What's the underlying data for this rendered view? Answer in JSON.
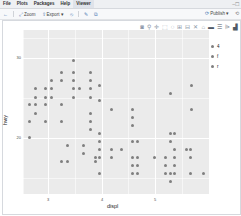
{
  "menubar": {
    "items": [
      "File",
      "Plots",
      "Packages",
      "Help",
      "Viewer"
    ],
    "active_index": 4,
    "window_controls": "–☐"
  },
  "toolbar": {
    "zoom_label": "Zoom",
    "export_label": "Export",
    "export_caret": "▾",
    "publish_label": "Publish",
    "publish_caret": "▾",
    "icons": {
      "back": "←",
      "zoom": "⤢",
      "export": "⇪",
      "clear": "⦸",
      "brush": "✎",
      "copy": "⧉",
      "publish": "⟳",
      "refresh": "⟲"
    }
  },
  "modebar": {
    "icons": [
      {
        "name": "camera-icon",
        "glyph": "◙"
      },
      {
        "name": "zoom-icon",
        "glyph": "⚲"
      },
      {
        "name": "pan-icon",
        "glyph": "✛"
      },
      {
        "name": "box-select-icon",
        "glyph": "⬚"
      },
      {
        "name": "lasso-icon",
        "glyph": "◌"
      },
      {
        "name": "zoom-in-icon",
        "glyph": "⊞"
      },
      {
        "name": "zoom-out-icon",
        "glyph": "⊟"
      },
      {
        "name": "autoscale-icon",
        "glyph": "✕"
      },
      {
        "name": "reset-axes-icon",
        "glyph": "⌂"
      },
      {
        "name": "spike-lines-icon",
        "glyph": "▬"
      },
      {
        "name": "compare-hover-icon",
        "glyph": "☰"
      },
      {
        "name": "closest-hover-icon",
        "glyph": "⩥"
      },
      {
        "name": "plotly-logo-icon",
        "glyph": "▟"
      }
    ]
  },
  "colors": {
    "panel_bg": "#ebebeb",
    "point": "#7f7f7f",
    "grid": "#ffffff"
  },
  "chart_data": {
    "type": "scatter",
    "title": "",
    "xlabel": "displ",
    "ylabel": "hwy",
    "x_ticks": [
      3,
      4,
      5
    ],
    "y_ticks": [
      20,
      30
    ],
    "x_tick_labels": [
      "3",
      "4",
      "5"
    ],
    "y_tick_labels": [
      "20",
      "30"
    ],
    "xlim": [
      2.5,
      6.0
    ],
    "ylim": [
      15.5,
      36
    ],
    "grid": true,
    "legend": {
      "position": "right",
      "title": "",
      "entries": [
        "4",
        "f",
        "r"
      ]
    },
    "points": [
      {
        "x": 3.49,
        "y": 29.6
      },
      {
        "x": 3.28,
        "y": 28.1
      },
      {
        "x": 3.49,
        "y": 28.1
      },
      {
        "x": 3.81,
        "y": 28.1
      },
      {
        "x": 3.09,
        "y": 27.1
      },
      {
        "x": 3.28,
        "y": 27.1
      },
      {
        "x": 3.49,
        "y": 27.1
      },
      {
        "x": 3.81,
        "y": 27.1
      },
      {
        "x": 2.78,
        "y": 26.1
      },
      {
        "x": 2.98,
        "y": 26.1
      },
      {
        "x": 3.09,
        "y": 26.1
      },
      {
        "x": 3.49,
        "y": 26.1
      },
      {
        "x": 3.6,
        "y": 26.1
      },
      {
        "x": 3.81,
        "y": 26.1
      },
      {
        "x": 2.78,
        "y": 25.0
      },
      {
        "x": 2.98,
        "y": 25.0
      },
      {
        "x": 3.09,
        "y": 25.0
      },
      {
        "x": 3.49,
        "y": 25.0
      },
      {
        "x": 3.81,
        "y": 25.0
      },
      {
        "x": 2.68,
        "y": 24.1
      },
      {
        "x": 2.78,
        "y": 24.1
      },
      {
        "x": 2.98,
        "y": 24.1
      },
      {
        "x": 3.28,
        "y": 24.1
      },
      {
        "x": 2.78,
        "y": 23.0
      },
      {
        "x": 3.81,
        "y": 23.0
      },
      {
        "x": 2.68,
        "y": 22.0
      },
      {
        "x": 2.98,
        "y": 22.0
      },
      {
        "x": 3.28,
        "y": 22.0
      },
      {
        "x": 3.81,
        "y": 22.0
      },
      {
        "x": 3.81,
        "y": 21.0
      },
      {
        "x": 2.68,
        "y": 20.0
      },
      {
        "x": 3.39,
        "y": 19.0
      },
      {
        "x": 3.69,
        "y": 19.0
      },
      {
        "x": 3.69,
        "y": 18.0
      },
      {
        "x": 3.28,
        "y": 17.0
      },
      {
        "x": 3.39,
        "y": 17.0
      },
      {
        "x": 3.9,
        "y": 17.0
      },
      {
        "x": 3.99,
        "y": 26.5
      },
      {
        "x": 5.71,
        "y": 26.5
      },
      {
        "x": 5.3,
        "y": 25.5
      },
      {
        "x": 3.99,
        "y": 24.6
      },
      {
        "x": 4.2,
        "y": 23.5
      },
      {
        "x": 4.59,
        "y": 23.5
      },
      {
        "x": 5.71,
        "y": 23.5
      },
      {
        "x": 4.59,
        "y": 22.5
      },
      {
        "x": 4.59,
        "y": 21.5
      },
      {
        "x": 3.99,
        "y": 20.5
      },
      {
        "x": 5.3,
        "y": 20.5
      },
      {
        "x": 5.39,
        "y": 20.5
      },
      {
        "x": 3.99,
        "y": 19.5
      },
      {
        "x": 4.59,
        "y": 19.5
      },
      {
        "x": 4.7,
        "y": 19.5
      },
      {
        "x": 5.3,
        "y": 19.5
      },
      {
        "x": 3.99,
        "y": 18.5
      },
      {
        "x": 4.2,
        "y": 18.5
      },
      {
        "x": 4.4,
        "y": 18.5
      },
      {
        "x": 5.39,
        "y": 18.5
      },
      {
        "x": 5.6,
        "y": 18.5
      },
      {
        "x": 5.69,
        "y": 18.5
      },
      {
        "x": 3.9,
        "y": 17.5
      },
      {
        "x": 3.99,
        "y": 17.5
      },
      {
        "x": 4.2,
        "y": 17.5
      },
      {
        "x": 4.59,
        "y": 17.5
      },
      {
        "x": 4.7,
        "y": 17.5
      },
      {
        "x": 5.0,
        "y": 17.5
      },
      {
        "x": 5.21,
        "y": 17.5
      },
      {
        "x": 5.39,
        "y": 17.5
      },
      {
        "x": 5.69,
        "y": 17.5
      },
      {
        "x": 4.59,
        "y": 16.5
      },
      {
        "x": 4.7,
        "y": 16.5
      },
      {
        "x": 5.21,
        "y": 16.5
      },
      {
        "x": 5.39,
        "y": 16.5
      },
      {
        "x": 3.99,
        "y": 15.5
      },
      {
        "x": 4.59,
        "y": 15.5
      },
      {
        "x": 4.7,
        "y": 15.5
      },
      {
        "x": 5.21,
        "y": 15.5
      },
      {
        "x": 5.3,
        "y": 15.5
      },
      {
        "x": 5.39,
        "y": 15.5
      },
      {
        "x": 5.69,
        "y": 15.5
      },
      {
        "x": 5.92,
        "y": 15.5
      },
      {
        "x": 5.3,
        "y": 14.5
      }
    ]
  }
}
